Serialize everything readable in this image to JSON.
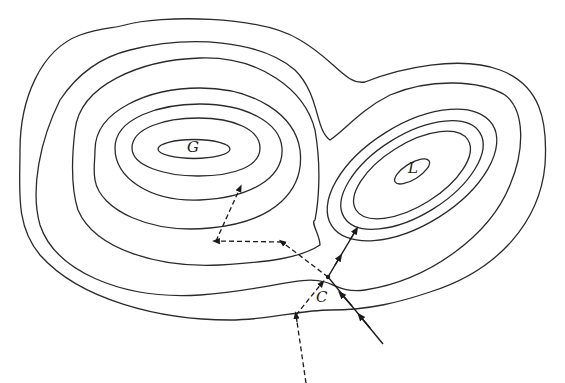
{
  "diagram": {
    "labels": {
      "global_max": "G",
      "local_max": "L",
      "start_point": "C"
    },
    "colors": {
      "stroke": "#2a2a2a",
      "background": "#ffffff"
    },
    "paths": [
      {
        "name": "solid-ascent-path",
        "style": "solid",
        "description": "Steepest ascent path from lower right through C toward L"
      },
      {
        "name": "dashed-ascent-path",
        "style": "dashed",
        "description": "Alternative path from bottom through C toward G"
      }
    ]
  }
}
